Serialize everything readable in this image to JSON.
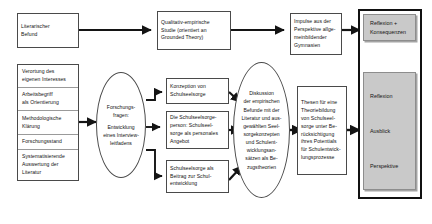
{
  "diagram": {
    "accent_gray": "#c9c9c9",
    "line_color": "#1a1a1a",
    "nodes": {
      "literarischer_befund": {
        "name": "Literarischer Befund",
        "lines": [
          "Literarischer",
          "Befund"
        ]
      },
      "grundlagen": {
        "name": "Grundlagen",
        "segments": [
          {
            "lines": [
              "Verortung des",
              "eigenen Interesses"
            ]
          },
          {
            "lines": [
              "Arbeitsbegriff",
              "als Orientierung"
            ]
          },
          {
            "lines": [
              "Methodologische",
              "Klärung"
            ]
          },
          {
            "lines": [
              "Forschungsstand"
            ]
          },
          {
            "lines": [
              "Systematisierende",
              "Auswertung der",
              "Literatur"
            ]
          }
        ]
      },
      "forschungsfragen": {
        "name": "Forschungsfragen",
        "lines": [
          "Forschungs-",
          "fragen:",
          "",
          "Entwicklung",
          "eines Interview-",
          "leitfadens"
        ]
      },
      "qualitativ_empirische_studie": {
        "name": "Qualitativ-empirische Studie",
        "lines": [
          "Qualitativ-empirische",
          "Studie (orientiert an",
          "Grounded Theory)"
        ]
      },
      "konzeption": {
        "name": "Konzeption von Schulseelsorge",
        "lines": [
          "Konzeption von",
          "Schulseelsorge"
        ]
      },
      "schulseelsorgeperson": {
        "name": "Die Schulseelsorgeperson",
        "lines": [
          "Die Schulseelsorge-",
          "person: Schulseel-",
          "sorge als personales",
          "Angebot"
        ]
      },
      "schulentwicklung": {
        "name": "Schulseelsorge als Beitrag zur Schulentwicklung",
        "lines": [
          "Schulseelsorge als",
          "Beitrag zur Schul-",
          "entwicklung"
        ]
      },
      "diskussion": {
        "name": "Diskussion der empirischen Befunde",
        "lines": [
          "Diskussion",
          "der empirischen",
          "Befunde mit der",
          "Literatur und aus-",
          "gewählten Seel-",
          "sorgekonzepten",
          "und Schulent-",
          "wicklungsan-",
          "sätzen als Be-",
          "zugstheorien"
        ]
      },
      "impulse": {
        "name": "Impulse aus der Perspektive allgemeinbildender Gymnasien",
        "lines": [
          "Impulse aus der",
          "Perspektive allge-",
          "meinbildender",
          "Gymnasien"
        ]
      },
      "thesen": {
        "name": "Thesen für eine Theoriebildung",
        "lines": [
          "Thesen für eine",
          "Theoriebildung",
          "von Schulseel-",
          "sorge unter Be-",
          "rücksichtigung",
          "ihres Potentials",
          "für Schulentwick-",
          "lungsprozesse"
        ]
      },
      "reflexion_konsequenzen": {
        "name": "Reflexion und Konsequenzen",
        "lines": [
          "Reflexion +",
          "Konsequenzen"
        ]
      },
      "ausblick_group": {
        "name": "Reflexion Ausblick Perspektive",
        "items": [
          "Reflexion",
          "Ausblick",
          "Perspektive"
        ]
      }
    }
  }
}
